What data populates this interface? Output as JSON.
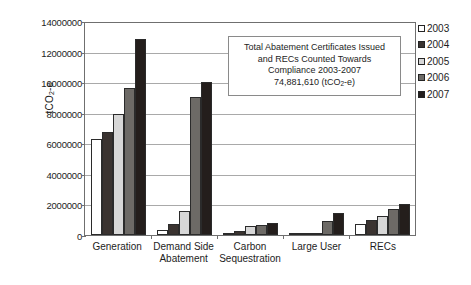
{
  "chart_data": {
    "type": "bar",
    "title": "",
    "xlabel": "",
    "ylabel": "tCO2-e",
    "ylabel_prefix": "tCO",
    "ylabel_sub": "2",
    "ylabel_suffix": "-e",
    "ylim": [
      0,
      14000000
    ],
    "ytick_values": [
      14000000,
      12000000,
      10000000,
      8000000,
      6000000,
      4000000,
      2000000,
      0
    ],
    "ytick_labels": [
      "14000000",
      "12000000",
      "10000000",
      "8000000",
      "6000000",
      "4000000",
      "2000000",
      "0"
    ],
    "grid": true,
    "legend_position": "right",
    "categories": [
      "Generation",
      "Demand Side Abatement",
      "Carbon Sequestration",
      "Large User",
      "RECs"
    ],
    "category_lines": [
      [
        "Generation"
      ],
      [
        "Demand Side",
        "Abatement"
      ],
      [
        "Carbon",
        "Sequestration"
      ],
      [
        "Large User"
      ],
      [
        "RECs"
      ]
    ],
    "series": [
      {
        "name": "2003",
        "color": "#ffffff",
        "values": [
          6300000,
          350000,
          20000,
          0,
          700000
        ]
      },
      {
        "name": "2004",
        "color": "#3a3330",
        "values": [
          6750000,
          750000,
          250000,
          0,
          980000
        ]
      },
      {
        "name": "2005",
        "color": "#d7d7d7",
        "values": [
          7900000,
          1550000,
          580000,
          150000,
          1270000
        ]
      },
      {
        "name": "2006",
        "color": "#6d6a66",
        "values": [
          9600000,
          9000000,
          650000,
          920000,
          1680000
        ]
      },
      {
        "name": "2007",
        "color": "#241e1c",
        "values": [
          12850000,
          10000000,
          780000,
          1420000,
          2050000
        ]
      }
    ]
  },
  "annotation": {
    "line1": "Total Abatement Certificates Issued",
    "line2": "and RECs Counted Towards",
    "line3": "Compliance 2003-2007",
    "line4_prefix": "74,881,610 (tCO",
    "line4_sub": "2",
    "line4_suffix": "-e)"
  }
}
